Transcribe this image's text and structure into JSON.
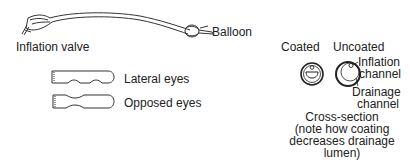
{
  "catheter": {
    "inflation_valve_label": "Inflation valve",
    "balloon_label": "Balloon"
  },
  "tips": [
    {
      "label": "Lateral eyes"
    },
    {
      "label": "Opposed eyes"
    }
  ],
  "cross_section": {
    "coated_label": "Coated",
    "uncoated_label": "Uncoated",
    "inflation_channel_label_line1": "Inflation",
    "inflation_channel_label_line2": "channel",
    "drainage_channel_label_line1": "Drainage",
    "drainage_channel_label_line2": "channel",
    "caption_lines": [
      "Cross-section",
      "(note how coating",
      "decreases drainage",
      "lumen)"
    ]
  },
  "colors": {
    "ink": "#222222",
    "background": "#ffffff"
  }
}
